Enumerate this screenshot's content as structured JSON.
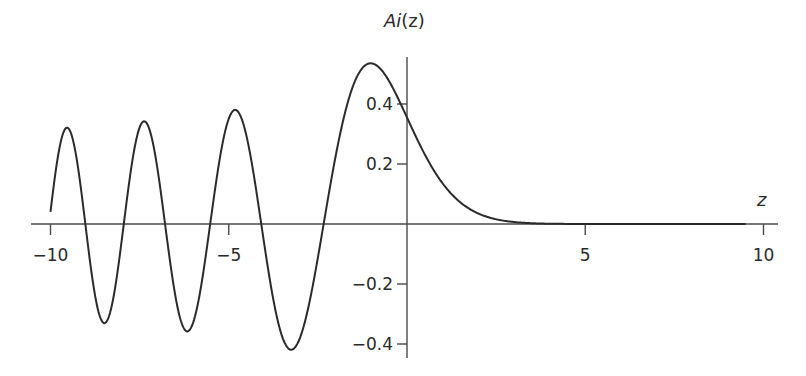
{
  "chart_data": {
    "type": "line",
    "title": "",
    "xlabel": "z",
    "ylabel": "Ai(z)",
    "xlim": [
      -10,
      10
    ],
    "ylim": [
      -0.45,
      0.55
    ],
    "x_ticks": [
      -10,
      -5,
      5,
      10
    ],
    "x_tick_labels": [
      "−10",
      "−5",
      "5",
      "10"
    ],
    "y_ticks": [
      0.4,
      0.2,
      -0.2,
      -0.4
    ],
    "y_tick_labels": [
      "0.4",
      "0.2",
      "−0.2",
      "−0.4"
    ],
    "grid": false,
    "legend": null,
    "series": [
      {
        "name": "Ai(z)",
        "function": "Airy function Ai(z)",
        "domain": [
          -10,
          9.5
        ],
        "x": [
          -10,
          -9.5,
          -9,
          -8.5,
          -8,
          -7.5,
          -7,
          -6.5,
          -6,
          -5.5,
          -5,
          -4.5,
          -4,
          -3.5,
          -3,
          -2.5,
          -2,
          -1.5,
          -1,
          -0.5,
          0,
          0.5,
          1,
          1.5,
          2,
          2.5,
          3,
          4,
          5,
          6,
          7,
          8,
          9,
          9.5
        ],
        "values": [
          0.0424,
          0.2799,
          0.0186,
          -0.3191,
          -0.0527,
          0.2779,
          0.1843,
          -0.1729,
          -0.3292,
          -0.0223,
          0.3507,
          0.2723,
          -0.0702,
          -0.3765,
          -0.3788,
          -0.1121,
          0.2274,
          0.4645,
          0.5356,
          0.4757,
          0.355,
          0.2317,
          0.1353,
          0.0717,
          0.0349,
          0.0157,
          0.0066,
          0.00095,
          0.00011,
          1e-05,
          0.0,
          0.0,
          0.0,
          0.0
        ]
      }
    ]
  },
  "axes": {
    "x_title": "z",
    "y_title_main": "Ai",
    "y_title_paren": "(z)"
  },
  "colors": {
    "curve": "#2b2b2b",
    "axis": "#4a4a4a",
    "text": "#2a2a2a"
  }
}
